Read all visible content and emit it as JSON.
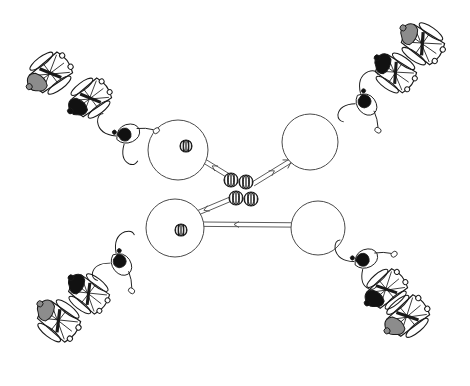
{
  "canvas": {
    "width": 470,
    "height": 386,
    "background": "#ffffff"
  },
  "diagram": {
    "title": "",
    "description": "Four-armed X-shaped schematic: four large open spheres near the centre, each connected by double-line arrow shafts to a cluster of four small striped spheres at the centre; each sphere arm extends outward to a chain of stylized wheelchair figures.",
    "layout": "x-cross",
    "arm_count": 4
  },
  "colors": {
    "stroke": "#4a4a4a",
    "outline": "#1a1a1a",
    "fill_white": "#ffffff",
    "fill_black": "#111111",
    "fill_grey": "#8c8c8c",
    "background": "#ffffff"
  },
  "spheres": [
    {
      "id": "sphere-top-left",
      "label": "",
      "cx": 178,
      "cy": 150,
      "r": 30,
      "has_inner_ball": true,
      "inner_ball": {
        "cx": 186,
        "cy": 146,
        "r": 6
      }
    },
    {
      "id": "sphere-top-right",
      "label": "",
      "cx": 310,
      "cy": 142,
      "r": 28,
      "has_inner_ball": false,
      "inner_ball": null
    },
    {
      "id": "sphere-bottom-left",
      "label": "",
      "cx": 175,
      "cy": 228,
      "r": 29,
      "has_inner_ball": true,
      "inner_ball": {
        "cx": 181,
        "cy": 230,
        "r": 6
      }
    },
    {
      "id": "sphere-bottom-right",
      "label": "",
      "cx": 318,
      "cy": 228,
      "r": 27,
      "has_inner_ball": false,
      "inner_ball": null
    }
  ],
  "center_balls": [
    {
      "id": "center-ball-1",
      "cx": 231,
      "cy": 180,
      "r": 7
    },
    {
      "id": "center-ball-2",
      "cx": 246,
      "cy": 182,
      "r": 7
    },
    {
      "id": "center-ball-3",
      "cx": 236,
      "cy": 198,
      "r": 7
    },
    {
      "id": "center-ball-4",
      "cx": 251,
      "cy": 199,
      "r": 7
    }
  ],
  "arrows": [
    {
      "id": "arrow-upper-left",
      "from": [
        232,
        178
      ],
      "to": [
        196,
        156
      ],
      "direction": "toward-sphere-top-left",
      "style": "double-line"
    },
    {
      "id": "arrow-upper-right",
      "from": [
        253,
        184
      ],
      "to": [
        292,
        160
      ],
      "direction": "toward-center",
      "style": "double-line"
    },
    {
      "id": "arrow-lower-left",
      "from": [
        238,
        196
      ],
      "to": [
        176,
        222
      ],
      "direction": "toward-sphere-bottom-left",
      "style": "double-line"
    },
    {
      "id": "arrow-lower-right",
      "from": [
        300,
        225
      ],
      "to": [
        180,
        224
      ],
      "direction": "toward-sphere-bottom-left",
      "style": "double-line"
    }
  ],
  "figure_chains": [
    {
      "id": "chain-top-left",
      "quadrant": "top-left",
      "figure_count": 3,
      "figures": [
        {
          "id": "figure-tl-outer",
          "x": 52,
          "y": 72,
          "rot": -37,
          "scale": 1.0,
          "body_fill": "grey",
          "type": "wheelchair-figure"
        },
        {
          "id": "figure-tl-middle",
          "x": 92,
          "y": 97,
          "rot": -37,
          "scale": 0.95,
          "body_fill": "black",
          "type": "wheelchair-figure"
        },
        {
          "id": "figure-tl-inner",
          "x": 128,
          "y": 133,
          "rot": -37,
          "scale": 0.8,
          "body_fill": "black",
          "type": "thrower-figure"
        }
      ]
    },
    {
      "id": "chain-top-right",
      "quadrant": "top-right",
      "figure_count": 3,
      "figures": [
        {
          "id": "figure-tr-outer",
          "x": 424,
          "y": 45,
          "rot": 35,
          "scale": 1.0,
          "body_fill": "grey",
          "type": "wheelchair-figure"
        },
        {
          "id": "figure-tr-middle",
          "x": 397,
          "y": 74,
          "rot": 35,
          "scale": 0.95,
          "body_fill": "black",
          "type": "wheelchair-figure"
        },
        {
          "id": "figure-tr-inner",
          "x": 367,
          "y": 104,
          "rot": 35,
          "scale": 0.8,
          "body_fill": "black",
          "type": "thrower-figure"
        }
      ]
    },
    {
      "id": "chain-bottom-left",
      "quadrant": "bottom-left",
      "figure_count": 3,
      "figures": [
        {
          "id": "figure-bl-outer",
          "x": 60,
          "y": 322,
          "rot": 38,
          "scale": 1.0,
          "body_fill": "grey",
          "type": "wheelchair-figure"
        },
        {
          "id": "figure-bl-middle",
          "x": 90,
          "y": 295,
          "rot": 38,
          "scale": 0.95,
          "body_fill": "black",
          "type": "wheelchair-figure"
        },
        {
          "id": "figure-bl-inner",
          "x": 122,
          "y": 264,
          "rot": 38,
          "scale": 0.8,
          "body_fill": "black",
          "type": "thrower-figure"
        }
      ]
    },
    {
      "id": "chain-bottom-right",
      "quadrant": "bottom-right",
      "figure_count": 3,
      "figures": [
        {
          "id": "figure-br-outer",
          "x": 409,
          "y": 315,
          "rot": -40,
          "scale": 1.0,
          "body_fill": "grey",
          "type": "wheelchair-figure"
        },
        {
          "id": "figure-br-middle",
          "x": 388,
          "y": 288,
          "rot": -40,
          "scale": 0.95,
          "body_fill": "black",
          "type": "wheelchair-figure"
        },
        {
          "id": "figure-br-inner",
          "x": 366,
          "y": 258,
          "rot": -40,
          "scale": 0.8,
          "body_fill": "black",
          "type": "thrower-figure"
        }
      ]
    }
  ]
}
